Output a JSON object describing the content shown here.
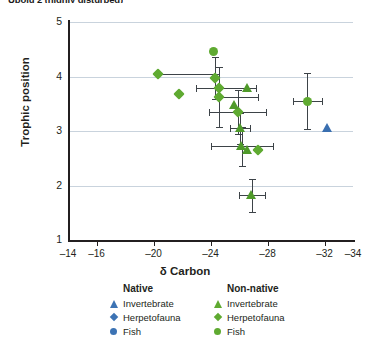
{
  "panel": {
    "title": "Upolu 2 (highly disturbed)"
  },
  "axes": {
    "x_label": "δ Carbon",
    "y_label": "Trophic position",
    "x_ticks": [
      "-14",
      "-16",
      "-20",
      "-24",
      "-28",
      "-32",
      "-34"
    ],
    "y_ticks": [
      "5",
      "4",
      "3",
      "2",
      "1"
    ]
  },
  "legend": {
    "native": {
      "heading": "Native",
      "color": "#3c73b4",
      "items": [
        {
          "label": "Invertebrate",
          "shape": "triangle"
        },
        {
          "label": "Herpetofauna",
          "shape": "diamond"
        },
        {
          "label": "Fish",
          "shape": "circle"
        }
      ]
    },
    "nonnative": {
      "heading": "Non-native",
      "color": "#5faa31",
      "items": [
        {
          "label": "Invertebrate",
          "shape": "triangle"
        },
        {
          "label": "Herpetofauna",
          "shape": "diamond"
        },
        {
          "label": "Fish",
          "shape": "circle"
        }
      ]
    }
  },
  "colors": {
    "native": "#3c73b4",
    "nonnative": "#5faa31",
    "native_triangle": "#3a6fb0",
    "nonnative_triangle": "#4f9a2a",
    "grid": "#c9d3dd",
    "axis": "#231f20",
    "error_bar": "#3d4348"
  },
  "chart_data": {
    "type": "scatter",
    "title": "Upolu 2 (highly disturbed)",
    "xlabel": "δ Carbon",
    "ylabel": "Trophic position",
    "xlim": [
      -14,
      -34
    ],
    "ylim": [
      1,
      5
    ],
    "x_reversed": true,
    "grid": "horizontal",
    "xticks": [
      -14,
      -16,
      -20,
      -24,
      -28,
      -32,
      -34
    ],
    "yticks": [
      1,
      2,
      3,
      4,
      5
    ],
    "legend_position": "below",
    "series": [
      {
        "name": "Non-native Herpetofauna",
        "group": "Non-native",
        "taxon": "Herpetofauna",
        "shape": "diamond",
        "color": "#5faa31",
        "points": [
          {
            "x": -20.3,
            "y": 4.05,
            "xerr_low": 0.0,
            "xerr_high": 4.3,
            "yerr": 0.0
          },
          {
            "x": -21.8,
            "y": 3.68,
            "xerr_low": 0.0,
            "xerr_high": 0.0,
            "yerr": 0.0
          },
          {
            "x": -24.3,
            "y": 3.97,
            "xerr_low": 0.0,
            "xerr_high": 0.0,
            "yerr": 0.38
          },
          {
            "x": -24.6,
            "y": 3.78,
            "xerr_low": 1.6,
            "xerr_high": 2.6,
            "yerr": 0.0
          },
          {
            "x": -24.6,
            "y": 3.62,
            "xerr_low": 0.0,
            "xerr_high": 2.7,
            "yerr": 0.55
          },
          {
            "x": -25.9,
            "y": 3.35,
            "xerr_low": 2.0,
            "xerr_high": 2.0,
            "yerr": 0.4
          },
          {
            "x": -27.3,
            "y": 2.66,
            "xerr_low": 0.0,
            "xerr_high": 0.0,
            "yerr": 0.0
          }
        ]
      },
      {
        "name": "Non-native Fish",
        "group": "Non-native",
        "taxon": "Fish",
        "shape": "circle",
        "color": "#5faa31",
        "points": [
          {
            "x": -24.2,
            "y": 4.45,
            "xerr_low": 0.0,
            "xerr_high": 0.0,
            "yerr": 0.0
          },
          {
            "x": -30.8,
            "y": 3.55,
            "xerr_low": 1.0,
            "xerr_high": 1.0,
            "yerr": 0.52
          }
        ]
      },
      {
        "name": "Non-native Invertebrate",
        "group": "Non-native",
        "taxon": "Invertebrate",
        "shape": "triangle",
        "color": "#4f9a2a",
        "points": [
          {
            "x": -26.6,
            "y": 3.78,
            "xerr_low": 0.0,
            "xerr_high": 0.0,
            "yerr": 0.0
          },
          {
            "x": -25.7,
            "y": 3.47,
            "xerr_low": 0.0,
            "xerr_high": 0.0,
            "yerr": 0.0
          },
          {
            "x": -26.1,
            "y": 3.05,
            "xerr_low": 0.7,
            "xerr_high": 0.7,
            "yerr": 0.28
          },
          {
            "x": -26.2,
            "y": 2.72,
            "xerr_low": 2.2,
            "xerr_high": 2.2,
            "yerr": 0.36
          },
          {
            "x": -26.6,
            "y": 2.64,
            "xerr_low": 0.0,
            "xerr_high": 0.0,
            "yerr": 0.0
          },
          {
            "x": -26.9,
            "y": 1.82,
            "xerr_low": 0.9,
            "xerr_high": 0.9,
            "yerr": 0.3
          }
        ]
      },
      {
        "name": "Native Invertebrate",
        "group": "Native",
        "taxon": "Invertebrate",
        "shape": "triangle",
        "color": "#3a6fb0",
        "points": [
          {
            "x": -32.2,
            "y": 3.05,
            "xerr_low": 0.0,
            "xerr_high": 0.0,
            "yerr": 0.0
          }
        ]
      }
    ]
  }
}
